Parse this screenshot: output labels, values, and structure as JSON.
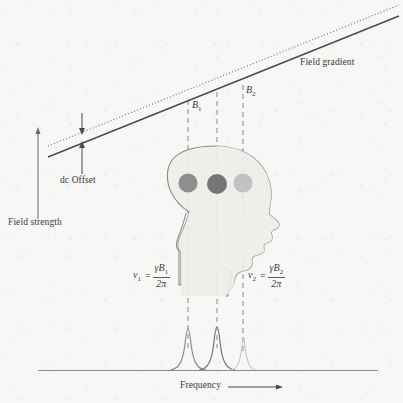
{
  "figure": {
    "domain": "scientific-diagram",
    "topic": "magnetic-resonance-imaging-field-gradient",
    "background_color": "#f7f7f5",
    "ink_color": "#4a4a4a"
  },
  "labels": {
    "field_gradient": "Field gradient",
    "dc_offset": "dc Offset",
    "field_strength": "Field strength",
    "frequency": "Frequency",
    "b1": "B",
    "b1_sub": "1",
    "b2": "B",
    "b2_sub": "2"
  },
  "equations": [
    {
      "id": "nu1",
      "lhs": "ν",
      "lhs_sub": "1",
      "eqsign": "=",
      "numerator": "γB",
      "numerator_sub": "1",
      "denominator": "2π",
      "x": 133,
      "y": 262
    },
    {
      "id": "nu2",
      "lhs": "ν",
      "lhs_sub": "2",
      "eqsign": "=",
      "numerator": "γB",
      "numerator_sub": "2",
      "denominator": "2π",
      "x": 248,
      "y": 262
    }
  ],
  "gradient_lines": {
    "solid": {
      "label": "field-gradient-line",
      "x1": 48,
      "y1": 156,
      "x2": 398,
      "y2": 16,
      "color": "#4a4a4a",
      "width": 1.3
    },
    "dotted": {
      "label": "baseline-field-line",
      "x1": 48,
      "y1": 146,
      "x2": 398,
      "y2": 6,
      "color": "#6b6b6b",
      "width": 1.1,
      "dash": "1,2.2"
    }
  },
  "dc_offset_arrow": {
    "x": 82,
    "y_top": 113,
    "y_bottom": 173,
    "gap_top": 133,
    "gap_bottom": 142,
    "double_headed": true
  },
  "field_strength_arrow": {
    "x": 38,
    "y_top": 128,
    "y_bottom": 219,
    "direction": "up"
  },
  "dashed_verticals": [
    {
      "name": "b1-line",
      "x": 188,
      "y_top": 100,
      "y_bottom": 348
    },
    {
      "name": "center-line",
      "x": 217,
      "y_top": 92,
      "y_bottom": 348
    },
    {
      "name": "b2-line",
      "x": 243,
      "y_top": 85,
      "y_bottom": 355
    }
  ],
  "b_labels": [
    {
      "name": "b1-label",
      "x": 191,
      "y": 103
    },
    {
      "name": "b2-label",
      "x": 246,
      "y": 88
    }
  ],
  "head": {
    "fill": "#ececea",
    "stroke": "#8a8a8a",
    "voxels": [
      {
        "name": "voxel-1",
        "cx": 188,
        "cy": 183,
        "r": 9.5,
        "color": "#8e8e8e"
      },
      {
        "name": "voxel-2",
        "cx": 217,
        "cy": 184,
        "r": 10.0,
        "color": "#757575"
      },
      {
        "name": "voxel-3",
        "cx": 243,
        "cy": 183,
        "r": 9.5,
        "color": "#c2c2c2"
      }
    ]
  },
  "spectrum": {
    "baseline": {
      "x1": 38,
      "y": 370,
      "x2": 378,
      "color": "#8a8a8a"
    },
    "peaks": [
      {
        "name": "peak-nu1",
        "center": 188,
        "height": 42,
        "half_width": 15,
        "color": "#8e8e8e"
      },
      {
        "name": "peak-nu2",
        "center": 217,
        "height": 44,
        "half_width": 15,
        "color": "#757575"
      },
      {
        "name": "peak-nu3",
        "center": 243,
        "height": 33,
        "half_width": 11,
        "color": "#c8c8c8"
      }
    ],
    "axis_arrow": {
      "x1": 228,
      "x2": 283,
      "y": 389
    }
  },
  "label_positions": {
    "field_gradient": {
      "x": 300,
      "y": 62
    },
    "dc_offset": {
      "x": 60,
      "y": 178
    },
    "field_strength": {
      "x": 8,
      "y": 222
    },
    "frequency": {
      "x": 180,
      "y": 384
    }
  }
}
